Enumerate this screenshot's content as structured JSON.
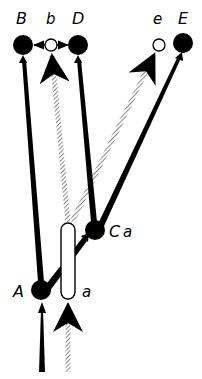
{
  "diagram": {
    "type": "node-link schematic",
    "colors": {
      "ink": "#000000",
      "background": "#ffffff",
      "hatched": "#9a9a9a"
    },
    "labels": {
      "B": "B",
      "b": "b",
      "D": "D",
      "e": "e",
      "E": "E",
      "C": "C",
      "C_sub": "a",
      "A": "A",
      "a": "a"
    },
    "nodes": [
      {
        "id": "B",
        "kind": "filled",
        "x": 23,
        "y": 45
      },
      {
        "id": "b",
        "kind": "open",
        "x": 51,
        "y": 45
      },
      {
        "id": "D",
        "kind": "filled",
        "x": 78,
        "y": 45
      },
      {
        "id": "e",
        "kind": "open",
        "x": 159,
        "y": 45
      },
      {
        "id": "E",
        "kind": "filled",
        "x": 183,
        "y": 43
      },
      {
        "id": "C",
        "kind": "filled",
        "x": 95,
        "y": 230
      },
      {
        "id": "A",
        "kind": "filled",
        "x": 41,
        "y": 290
      },
      {
        "id": "a",
        "kind": "capsule",
        "x": 68,
        "y": 262
      }
    ],
    "edges": [
      {
        "from": "A",
        "to": "B",
        "style": "solid-thick"
      },
      {
        "from": "A",
        "to": "C",
        "style": "solid-thick"
      },
      {
        "from": "C",
        "to": "D",
        "style": "solid-thick"
      },
      {
        "from": "C",
        "to": "E",
        "style": "solid-thick"
      },
      {
        "from": "a",
        "to": "b",
        "style": "hatched"
      },
      {
        "from": "a",
        "to": "e",
        "style": "hatched"
      },
      {
        "from": "b",
        "to": "B",
        "style": "solid-thin"
      },
      {
        "from": "b",
        "to": "D",
        "style": "solid-thin"
      },
      {
        "from": "input",
        "to": "A",
        "style": "solid-thick"
      },
      {
        "from": "input",
        "to": "a",
        "style": "hatched"
      }
    ]
  }
}
